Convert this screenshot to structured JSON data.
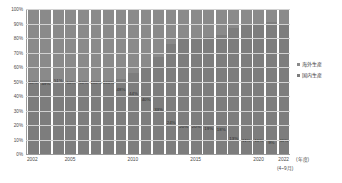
{
  "chart_data": {
    "type": "bar",
    "stacked": true,
    "normalized": "100%",
    "title": "",
    "subtitle": "",
    "xlabel": "(年度)",
    "xlabel_note": "(4~9月)",
    "ylabel": "",
    "ylim": [
      0,
      100
    ],
    "ytick_labels": [
      "100%",
      "90%",
      "80%",
      "70%",
      "60%",
      "50%",
      "40%",
      "30%",
      "20%",
      "10%",
      "0%"
    ],
    "ytick_values": [
      100,
      90,
      80,
      70,
      60,
      50,
      40,
      30,
      20,
      10,
      0
    ],
    "grid": true,
    "legend_position": "right",
    "categories": [
      "2002",
      "2003",
      "2004",
      "2005",
      "2006",
      "2007",
      "2008",
      "2009",
      "2010",
      "2011",
      "2012",
      "2013",
      "2014",
      "2015",
      "2016",
      "2017",
      "2018",
      "2019",
      "2020",
      "2021",
      "2022"
    ],
    "xtick_labels_shown": [
      "2002",
      "2005",
      "2010",
      "2015",
      "2020",
      "2022"
    ],
    "series": [
      {
        "name": "海外生産",
        "color": "#8a8a8a",
        "values": [
          50,
          49,
          51,
          50,
          50,
          50,
          50,
          48,
          44,
          40,
          33,
          24,
          20,
          20,
          19,
          18,
          13,
          11,
          11,
          9,
          11
        ]
      },
      {
        "name": "国内生産",
        "color": "#7d7d7d",
        "values": [
          50,
          51,
          49,
          50,
          50,
          50,
          50,
          52,
          56,
          60,
          67,
          76,
          80,
          80,
          81,
          82,
          87,
          89,
          89,
          91,
          89
        ]
      }
    ],
    "data_labels": [
      "50%",
      "49%",
      "51%",
      "50%",
      "50%",
      "100%",
      "100%",
      "48%",
      "44%",
      "40%",
      "33%",
      "24%",
      "20%",
      "20%",
      "19%",
      "18%",
      "13%",
      "11%",
      "11%",
      "9%",
      "11%"
    ],
    "bar_labels": [
      {
        "text": "50%",
        "value": 50
      },
      {
        "text": "49%",
        "value": 49
      },
      {
        "text": "51%",
        "value": 51
      },
      {
        "text": "50%",
        "value": 50
      },
      {
        "text": "50%",
        "value": 50
      },
      {
        "text": "100%",
        "value": 50
      },
      {
        "text": "100%",
        "value": 50
      },
      {
        "text": "48%",
        "value": 45
      },
      {
        "text": "44%",
        "value": 42
      },
      {
        "text": "40%",
        "value": 38
      },
      {
        "text": "33%",
        "value": 31
      },
      {
        "text": "24%",
        "value": 22
      },
      {
        "text": "20%",
        "value": 19
      },
      {
        "text": "20%",
        "value": 19
      },
      {
        "text": "19%",
        "value": 18
      },
      {
        "text": "18%",
        "value": 17
      },
      {
        "text": "13%",
        "value": 11
      },
      {
        "text": "11%",
        "value": 10
      },
      {
        "text": "11%",
        "value": 10
      },
      {
        "text": "9%",
        "value": 8
      },
      {
        "text": "11%",
        "value": 10
      }
    ]
  },
  "legend": {
    "items": [
      {
        "label": "海外生産",
        "color": "#8a8a8a"
      },
      {
        "label": "国内生産",
        "color": "#7d7d7d"
      }
    ]
  },
  "axis": {
    "x_unit_label": "(年度)",
    "x_sub_note": "(4~9月)"
  },
  "colors": {
    "bar_overseas": "#8a8a8a",
    "bar_domestic": "#7d7d7d",
    "grid": "#d2d2d2",
    "axis": "#9a9a9a",
    "text": "#4a4a4a",
    "background": "#ffffff"
  }
}
